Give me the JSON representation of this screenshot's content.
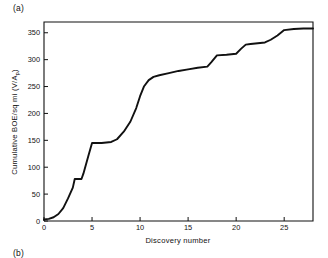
{
  "figure": {
    "panel_label_a": "(a)",
    "panel_label_b": "(b)",
    "line_color": "#111111",
    "background_color": "#ffffff"
  },
  "chart_data": {
    "type": "line",
    "title": "",
    "subtitle": "",
    "xlabel": "Discovery number",
    "ylabel": "Cumulative BOE/sq mi  (V/A",
    "ylabel_subscript": "p",
    "ylabel_suffix": ")",
    "ylabel_full": "Cumulative BOE/sq mi (V/Ap)",
    "xlim": [
      0,
      28
    ],
    "ylim": [
      0,
      370
    ],
    "xticks": [
      0,
      5,
      10,
      15,
      20,
      25
    ],
    "yticks": [
      0,
      50,
      100,
      150,
      200,
      250,
      300,
      350
    ],
    "xticklabels": [
      "0",
      "5",
      "10",
      "15",
      "20",
      "25"
    ],
    "yticklabels": [
      "0",
      "50",
      "100",
      "150",
      "200",
      "250",
      "300",
      "350"
    ],
    "grid": false,
    "legend": false,
    "legend_position": "none",
    "series": [
      {
        "name": "Cumulative BOE per square mile",
        "x": [
          0,
          0.5,
          1.0,
          1.5,
          2.0,
          2.5,
          3.0,
          3.2,
          3.9,
          4.1,
          4.6,
          5.0,
          6.0,
          7.0,
          7.6,
          8.3,
          9.0,
          9.6,
          10.0,
          10.4,
          10.9,
          11.4,
          12.0,
          13.0,
          14.0,
          15.0,
          16.0,
          17.0,
          17.4,
          18.0,
          19.0,
          20.0,
          20.5,
          21.0,
          21.5,
          22.0,
          23.0,
          23.6,
          24.3,
          25.0,
          26.0,
          27.0,
          28.0
        ],
        "y": [
          3,
          4,
          7,
          13,
          24,
          42,
          62,
          78,
          78,
          88,
          120,
          145,
          145,
          147,
          152,
          166,
          185,
          210,
          232,
          250,
          262,
          268,
          271,
          275,
          279,
          282,
          285,
          287,
          295,
          308,
          309,
          311,
          320,
          328,
          329,
          330,
          332,
          337,
          345,
          355,
          357,
          358,
          358
        ]
      }
    ],
    "annotations": []
  }
}
